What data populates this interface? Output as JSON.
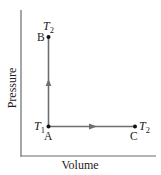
{
  "axes": {
    "x_label": "Volume",
    "y_label": "Pressure"
  },
  "points": [
    {
      "id": "A",
      "label": "A",
      "temperature": "T",
      "temperature_sub": "1"
    },
    {
      "id": "B",
      "label": "B",
      "temperature": "T",
      "temperature_sub": "2"
    },
    {
      "id": "C",
      "label": "C",
      "temperature": "T",
      "temperature_sub": "2"
    }
  ],
  "paths": [
    {
      "from": "A",
      "to": "B",
      "direction": "up"
    },
    {
      "from": "A",
      "to": "C",
      "direction": "right"
    }
  ],
  "colors": {
    "axis": "#6b6b6b",
    "path": "#6e6e6e",
    "point": "#111111",
    "text": "#222222"
  }
}
